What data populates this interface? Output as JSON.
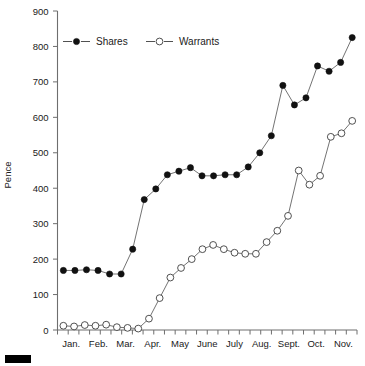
{
  "chart_data": {
    "type": "line",
    "title": "",
    "subtitle": "",
    "xlabel": "",
    "ylabel": "Pence",
    "ylim": [
      0,
      900
    ],
    "ytick_step": 100,
    "yticks": [
      0,
      100,
      200,
      300,
      400,
      500,
      600,
      700,
      800,
      900
    ],
    "ytick_labels": [
      "0",
      "100",
      "200",
      "300",
      "400",
      "500",
      "600",
      "700",
      "800",
      "900"
    ],
    "xtick_labels": [
      "Jan.",
      "Feb.",
      "Mar.",
      "Apr.",
      "May",
      "June",
      "July",
      "Aug.",
      "Sept.",
      "Oct.",
      "Nov."
    ],
    "grid": false,
    "legend_position": "top-left-inside",
    "n_points": 28,
    "x_minor_ticks": 28,
    "series": [
      {
        "name": "Shares",
        "marker": "filled-circle",
        "values": [
          168,
          168,
          170,
          168,
          158,
          158,
          228,
          368,
          398,
          438,
          448,
          458,
          435,
          435,
          438,
          438,
          460,
          500,
          548,
          690,
          635,
          655,
          745,
          730,
          755,
          825
        ]
      },
      {
        "name": "Warrants",
        "marker": "open-circle",
        "values": [
          12,
          10,
          14,
          12,
          15,
          8,
          6,
          4,
          32,
          90,
          148,
          175,
          200,
          228,
          240,
          228,
          218,
          215,
          215,
          248,
          280,
          322,
          450,
          410,
          435,
          545,
          555,
          590
        ]
      }
    ]
  },
  "legend": {
    "entries": [
      {
        "label": "Shares",
        "marker": "filled-circle",
        "color": "#111111"
      },
      {
        "label": "Warrants",
        "marker": "open-circle",
        "color": "#3d3d3d"
      }
    ]
  },
  "axes": {
    "y_title": "Pence",
    "axis_color": "#6e6e6e"
  }
}
